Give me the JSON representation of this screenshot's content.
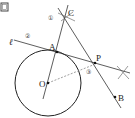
{
  "diagram": {
    "figure_icon": "figure-box-icon",
    "points": {
      "O": {
        "label": "O",
        "x": 48,
        "y": 83
      },
      "A": {
        "label": "A",
        "x": 57,
        "y": 52
      },
      "P": {
        "label": "P",
        "x": 95,
        "y": 63
      },
      "B": {
        "label": "B",
        "x": 115,
        "y": 97
      },
      "C": {
        "label": "C",
        "x": 65,
        "y": 17
      }
    },
    "line_label": "ℓ",
    "step_labels": [
      "①",
      "②",
      "③"
    ],
    "colors": {
      "stroke": "#2a2a2a",
      "dashed": "#666666"
    }
  }
}
